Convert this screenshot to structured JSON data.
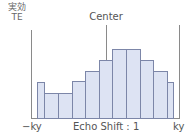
{
  "chart_data": {
    "type": "bar",
    "title": "",
    "ylabel": "実効 TE",
    "ylabel_line1": "実効",
    "ylabel_line2": "TE",
    "xlabel": "Echo Shift : 1",
    "x_tick_left": "−ky",
    "x_tick_right": "ky",
    "center_label": "Center",
    "categories": [
      "1",
      "2",
      "3",
      "4",
      "5",
      "6",
      "7",
      "8",
      "9",
      "10",
      "11"
    ],
    "values": [
      37,
      26,
      26,
      38,
      48,
      59,
      70,
      70,
      59,
      48,
      37
    ],
    "bars_px": [
      {
        "x": 37,
        "w": 7,
        "h": 37
      },
      {
        "x": 44,
        "w": 14,
        "h": 26
      },
      {
        "x": 58,
        "w": 14,
        "h": 26
      },
      {
        "x": 72,
        "w": 13,
        "h": 38
      },
      {
        "x": 85,
        "w": 14,
        "h": 48
      },
      {
        "x": 99,
        "w": 13,
        "h": 59
      },
      {
        "x": 112,
        "w": 14,
        "h": 70
      },
      {
        "x": 126,
        "w": 14,
        "h": 70
      },
      {
        "x": 140,
        "w": 13,
        "h": 59
      },
      {
        "x": 153,
        "w": 14,
        "h": 48
      },
      {
        "x": 167,
        "w": 6,
        "h": 37
      }
    ],
    "grid": false,
    "legend": null,
    "colors": {
      "bar_fill": "#dde3f3",
      "bar_border": "#7c86a8",
      "axis": "#8a8a8a"
    }
  }
}
